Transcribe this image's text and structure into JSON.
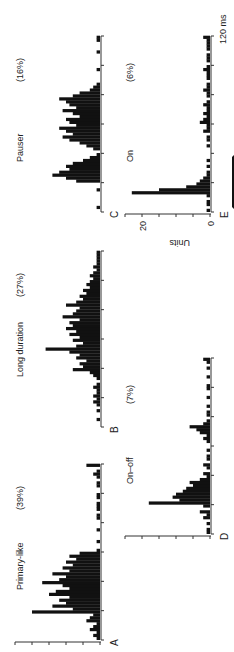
{
  "figure": {
    "orientation": "rotated-90-ccw",
    "time_axis_label": "120 ms",
    "y_axis_label": "Units",
    "y_ticks": [
      "0",
      "20"
    ],
    "bar_color": "#111111",
    "axis_color": "#333333"
  },
  "panels": [
    {
      "letter": "A",
      "name": "Primary-like",
      "percent": "(39%)"
    },
    {
      "letter": "B",
      "name": "Long duration",
      "percent": "(27%)"
    },
    {
      "letter": "C",
      "name": "Pauser",
      "percent": "(16%)"
    },
    {
      "letter": "D",
      "name": "On–off",
      "percent": "(7%)"
    },
    {
      "letter": "E",
      "name": "On",
      "percent": "(6%)"
    }
  ],
  "chart_data": [
    {
      "type": "bar",
      "title": "Primary-like (39%)",
      "panel": "A",
      "xlabel": "Time (ms)",
      "ylabel": "Units",
      "xlim": [
        0,
        120
      ],
      "ylim": [
        0,
        25
      ],
      "x": [
        0,
        2,
        4,
        6,
        8,
        10,
        12,
        14,
        16,
        18,
        20,
        22,
        24,
        26,
        28,
        30,
        32,
        34,
        36,
        38,
        40,
        42,
        44,
        46,
        48,
        50,
        52,
        54,
        56,
        58,
        60,
        62,
        64,
        66,
        68,
        70,
        72,
        74,
        76,
        78,
        80,
        82,
        84,
        86,
        88,
        90,
        92,
        94,
        96,
        98,
        100,
        102,
        104,
        106,
        108,
        110,
        112,
        114,
        116,
        118
      ],
      "values": [
        1,
        2,
        1,
        3,
        2,
        1,
        4,
        3,
        2,
        20,
        8,
        14,
        10,
        12,
        9,
        15,
        13,
        9,
        11,
        17,
        12,
        10,
        14,
        9,
        11,
        8,
        10,
        7,
        9,
        6,
        1,
        0,
        0,
        1,
        0,
        0,
        0,
        1,
        0,
        0,
        0,
        1,
        1,
        0,
        1,
        1,
        1,
        0,
        1,
        1,
        0,
        0,
        1,
        1,
        0,
        1,
        2,
        1,
        0,
        4
      ]
    },
    {
      "type": "bar",
      "title": "Long duration (27%)",
      "panel": "B",
      "xlabel": "Time (ms)",
      "ylabel": "Units",
      "xlim": [
        0,
        120
      ],
      "ylim": [
        0,
        25
      ],
      "x": [
        0,
        2,
        4,
        6,
        8,
        10,
        12,
        14,
        16,
        18,
        20,
        22,
        24,
        26,
        28,
        30,
        32,
        34,
        36,
        38,
        40,
        42,
        44,
        46,
        48,
        50,
        52,
        54,
        56,
        58,
        60,
        62,
        64,
        66,
        68,
        70,
        72,
        74,
        76,
        78,
        80,
        82,
        84,
        86,
        88,
        90,
        92,
        94,
        96,
        98,
        100,
        102,
        104,
        106,
        108,
        110,
        112,
        114,
        116,
        118
      ],
      "values": [
        0,
        0,
        1,
        0,
        0,
        1,
        0,
        1,
        2,
        1,
        2,
        1,
        1,
        2,
        1,
        0,
        1,
        2,
        3,
        8,
        5,
        6,
        4,
        7,
        6,
        9,
        16,
        7,
        5,
        8,
        6,
        9,
        7,
        10,
        8,
        9,
        6,
        11,
        8,
        7,
        6,
        10,
        7,
        5,
        6,
        4,
        5,
        3,
        4,
        3,
        2,
        3,
        2,
        1,
        2,
        1,
        1,
        1,
        1,
        1
      ]
    },
    {
      "type": "bar",
      "title": "Pauser (16%)",
      "panel": "C",
      "xlabel": "Time (ms)",
      "ylabel": "Units",
      "xlim": [
        0,
        120
      ],
      "ylim": [
        0,
        25
      ],
      "x": [
        0,
        2,
        4,
        6,
        8,
        10,
        12,
        14,
        16,
        18,
        20,
        22,
        24,
        26,
        28,
        30,
        32,
        34,
        36,
        38,
        40,
        42,
        44,
        46,
        48,
        50,
        52,
        54,
        56,
        58,
        60,
        62,
        64,
        66,
        68,
        70,
        72,
        74,
        76,
        78,
        80,
        82,
        84,
        86,
        88,
        90,
        92,
        94,
        96,
        98,
        100,
        102,
        104,
        106,
        108,
        110,
        112,
        114,
        116,
        118
      ],
      "values": [
        0,
        1,
        0,
        0,
        0,
        0,
        0,
        1,
        0,
        0,
        7,
        10,
        14,
        12,
        9,
        10,
        8,
        5,
        3,
        1,
        0,
        2,
        4,
        6,
        9,
        11,
        8,
        10,
        12,
        7,
        9,
        10,
        6,
        8,
        11,
        7,
        9,
        10,
        12,
        8,
        6,
        3,
        2,
        1,
        0,
        0,
        0,
        0,
        1,
        0,
        0,
        0,
        0,
        0,
        1,
        0,
        0,
        0,
        1,
        1
      ]
    },
    {
      "type": "bar",
      "title": "On–off (7%)",
      "panel": "D",
      "xlabel": "Time (ms)",
      "ylabel": "Units",
      "xlim": [
        0,
        120
      ],
      "ylim": [
        0,
        25
      ],
      "x": [
        0,
        2,
        4,
        6,
        8,
        10,
        12,
        14,
        16,
        18,
        20,
        22,
        24,
        26,
        28,
        30,
        32,
        34,
        36,
        38,
        40,
        42,
        44,
        46,
        48,
        50,
        52,
        54,
        56,
        58,
        60,
        62,
        64,
        66,
        68,
        70,
        72,
        74,
        76,
        78,
        80,
        82,
        84,
        86,
        88,
        90,
        92,
        94,
        96,
        98,
        100,
        102,
        104,
        106,
        108,
        110,
        112,
        114,
        116,
        118
      ],
      "values": [
        1,
        1,
        0,
        1,
        0,
        2,
        1,
        3,
        0,
        2,
        18,
        9,
        11,
        10,
        8,
        7,
        5,
        6,
        3,
        1,
        2,
        0,
        1,
        2,
        0,
        1,
        1,
        0,
        1,
        0,
        0,
        1,
        2,
        1,
        3,
        4,
        6,
        2,
        1,
        0,
        1,
        1,
        0,
        1,
        0,
        0,
        1,
        0,
        0,
        1,
        1,
        0,
        0,
        1,
        0,
        0,
        1,
        0,
        1,
        2
      ]
    },
    {
      "type": "bar",
      "title": "On (6%)",
      "panel": "E",
      "xlabel": "Time (ms)",
      "ylabel": "Units",
      "xlim": [
        0,
        120
      ],
      "ylim": [
        0,
        25
      ],
      "yticks": [
        0,
        20
      ],
      "x": [
        0,
        2,
        4,
        6,
        8,
        10,
        12,
        14,
        16,
        18,
        20,
        22,
        24,
        26,
        28,
        30,
        32,
        34,
        36,
        38,
        40,
        42,
        44,
        46,
        48,
        50,
        52,
        54,
        56,
        58,
        60,
        62,
        64,
        66,
        68,
        70,
        72,
        74,
        76,
        78,
        80,
        82,
        84,
        86,
        88,
        90,
        92,
        94,
        96,
        98,
        100,
        102,
        104,
        106,
        108,
        110,
        112,
        114,
        116,
        118
      ],
      "values": [
        1,
        0,
        1,
        1,
        0,
        1,
        23,
        15,
        7,
        4,
        3,
        2,
        1,
        1,
        0,
        1,
        0,
        1,
        0,
        0,
        0,
        0,
        1,
        0,
        1,
        1,
        0,
        2,
        1,
        1,
        3,
        2,
        1,
        2,
        1,
        1,
        2,
        1,
        0,
        1,
        1,
        2,
        1,
        1,
        0,
        1,
        1,
        1,
        2,
        1,
        0,
        1,
        1,
        1,
        0,
        1,
        1,
        1,
        1,
        2
      ]
    }
  ]
}
